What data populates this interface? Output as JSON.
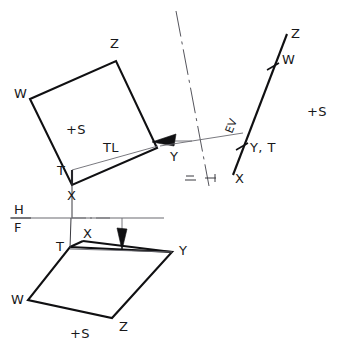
{
  "figure": {
    "type": "orthographic-projection-diagram",
    "colors": {
      "ink": "#101012",
      "thin_ink": "#6a6a70",
      "background": "#ffffff"
    },
    "views": {
      "top_view": {
        "name": "horizontal-view-quadrilateral",
        "vertices": [
          {
            "label": "W",
            "x": 30,
            "y": 99,
            "label_x": 14,
            "label_y": 98
          },
          {
            "label": "Z",
            "x": 116,
            "y": 61,
            "label_x": 110,
            "label_y": 48
          },
          {
            "label": "Y",
            "x": 157,
            "y": 148,
            "label_x": 170,
            "label_y": 161
          },
          {
            "label": "X",
            "x": 72,
            "y": 185,
            "label_x": 67,
            "label_y": 200
          },
          {
            "label": "T",
            "x": 72,
            "y": 170,
            "label_x": 58,
            "label_y": 170
          }
        ],
        "marker": "+S",
        "marker_x": 72,
        "marker_y": 131,
        "true_length_label": "TL",
        "true_length_label_x": 103,
        "true_length_label_y": 152
      },
      "front_view": {
        "name": "frontal-view-quadrilateral",
        "vertices": [
          {
            "label": "T",
            "x": 70,
            "y": 247,
            "label_x": 57,
            "label_y": 246
          },
          {
            "label": "X",
            "x": 82,
            "y": 241,
            "label_x": 84,
            "label_y": 236
          },
          {
            "label": "Y",
            "x": 172,
            "y": 252,
            "label_x": 180,
            "label_y": 252
          },
          {
            "label": "Z",
            "x": 112,
            "y": 318,
            "label_x": 120,
            "label_y": 328
          },
          {
            "label": "W",
            "x": 28,
            "y": 300,
            "label_x": 12,
            "label_y": 301
          }
        ],
        "marker": "+S",
        "marker_x": 78,
        "marker_y": 334
      },
      "edge_view": {
        "name": "edge-view-line",
        "label": "EV",
        "label_x": 233,
        "label_y": 130,
        "endpoints": {
          "x1": 233,
          "y1": 175,
          "x2": 287,
          "y2": 34
        },
        "point_labels": [
          {
            "label": "Z",
            "x": 292,
            "y": 37
          },
          {
            "label": "W",
            "x": 284,
            "y": 60
          },
          {
            "label": "Y, T",
            "x": 249,
            "y": 150
          },
          {
            "label": "X",
            "x": 236,
            "y": 181
          }
        ],
        "marker": "+S",
        "marker_x": 312,
        "marker_y": 113
      }
    },
    "fold_lines": [
      {
        "name": "H-F-fold-line",
        "upper_label": "H",
        "lower_label": "F",
        "upper_label_x": 17,
        "upper_label_y": 212,
        "lower_label_x": 17,
        "lower_label_y": 231,
        "x1": 10,
        "y1": 218,
        "x2": 164,
        "y2": 218
      },
      {
        "name": "H-EV-fold-line",
        "upper_label": "H",
        "lower_label": "1",
        "upper_label_x": 190,
        "upper_label_y": 182,
        "lower_label_x": 0,
        "lower_label_y": 0,
        "x1": 0,
        "y1": 0,
        "x2": 0,
        "y2": 0
      }
    ],
    "projection_lines": {
      "name": "projection-construction-lines",
      "center_line": {
        "x1": 176,
        "y1": 11,
        "x2": 209,
        "y2": 186
      },
      "sight_line": {
        "x1": 160,
        "y1": 146,
        "x2": 242,
        "y2": 133
      }
    },
    "arrows": [
      {
        "name": "line-of-sight-arrow-top",
        "direction": "left",
        "tail_x": 190,
        "tail_y": 141,
        "tip_x": 152,
        "tip_y": 142
      },
      {
        "name": "line-of-sight-arrow-front",
        "direction": "down",
        "tail_x": 122,
        "tail_y": 218,
        "tip_x": 122,
        "tip_y": 249
      }
    ],
    "annotations": {
      "tl": "TL",
      "ev": "EV",
      "s_marker": "+S",
      "h_label": "H",
      "f_label": "F",
      "yt_label": "Y, T"
    }
  }
}
